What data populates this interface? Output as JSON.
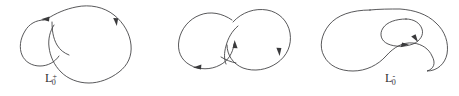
{
  "figure": {
    "kind": "knot-skein-triple",
    "width": 459,
    "height": 96,
    "background_color": "#ffffff",
    "stroke_color": "#3a3a3c",
    "caption_color": "#2f2f31"
  },
  "panels": [
    {
      "id": "plus",
      "name": "positive-crossing-diagram",
      "label": {
        "base": "L",
        "sub": "0",
        "sup": "+",
        "full": "L0+"
      },
      "description": "Hand-drawn link diagram with one positive crossing: a small left lobe passing under a large right lobe",
      "crossing_sign": "+",
      "arrow_count": 2
    },
    {
      "id": "minus",
      "name": "negative-crossing-diagram",
      "label": {
        "base": "L",
        "sub": "0",
        "sup": "-",
        "full": "L0-"
      },
      "description": "Hand-drawn link diagram with one negative crossing: two overlapping lobes of similar size",
      "crossing_sign": "-",
      "arrow_count": 3
    },
    {
      "id": "zero",
      "name": "zero-smoothing-diagram",
      "label": {
        "base": "L",
        "sub": "0",
        "sup": "0",
        "full": "L00"
      },
      "description": "Hand-drawn diagram of the oriented smoothing: a kidney-shaped outer curve enclosing a small inner loop",
      "crossing_sign": "0",
      "arrow_count": 2
    }
  ]
}
